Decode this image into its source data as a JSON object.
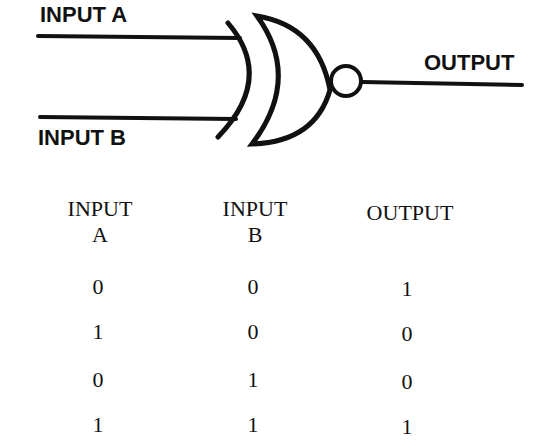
{
  "diagram": {
    "gate_type": "XNOR",
    "input_a_label": "INPUT A",
    "input_b_label": "INPUT B",
    "output_label": "OUTPUT",
    "stroke_color": "#111111"
  },
  "truth_table": {
    "headers": [
      {
        "line1": "INPUT",
        "line2": "A"
      },
      {
        "line1": "INPUT",
        "line2": "B"
      },
      {
        "line1": "OUTPUT",
        "line2": ""
      }
    ],
    "rows": [
      [
        "0",
        "0",
        "1"
      ],
      [
        "1",
        "0",
        "0"
      ],
      [
        "0",
        "1",
        "0"
      ],
      [
        "1",
        "1",
        "1"
      ]
    ]
  }
}
